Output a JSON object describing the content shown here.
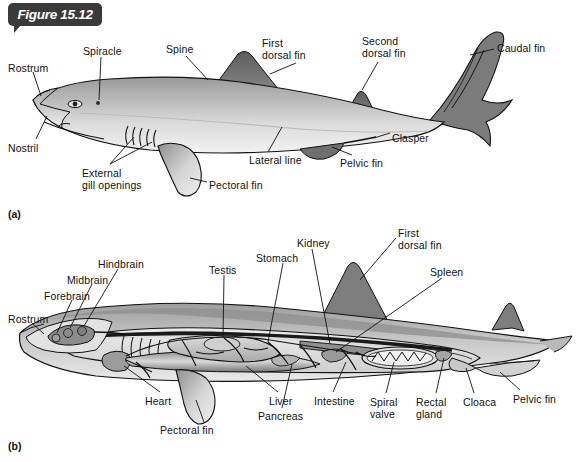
{
  "figure": {
    "tag_label": "Figure 15.12",
    "panel_a_id": "(a)",
    "panel_b_id": "(b)",
    "background_color": "#ffffff",
    "tag_color": "#3a3a3a",
    "line_color": "#111111",
    "body_light": "#e8e8e8",
    "body_mid": "#b5b5b5",
    "body_dark": "#6e6e6e",
    "fin_dark": "#707070"
  },
  "panel_a": {
    "title": "External anatomy of a shark",
    "labels": [
      {
        "id": "rostrum",
        "text": "Rostrum",
        "x": 8,
        "y": 63
      },
      {
        "id": "spiracle",
        "text": "Spiracle",
        "x": 83,
        "y": 46
      },
      {
        "id": "spine",
        "text": "Spine",
        "x": 166,
        "y": 44
      },
      {
        "id": "first-dorsal",
        "text": "First\ndorsal fin",
        "x": 262,
        "y": 38
      },
      {
        "id": "second-dorsal",
        "text": "Second\ndorsal fin",
        "x": 362,
        "y": 36
      },
      {
        "id": "caudal-fin",
        "text": "Caudal fin",
        "x": 497,
        "y": 43
      },
      {
        "id": "clasper",
        "text": "Clasper",
        "x": 392,
        "y": 133
      },
      {
        "id": "pelvic-fin",
        "text": "Pelvic fin",
        "x": 340,
        "y": 158
      },
      {
        "id": "lateral-line",
        "text": "Lateral line",
        "x": 249,
        "y": 155
      },
      {
        "id": "pectoral-fin",
        "text": "Pectoral fin",
        "x": 209,
        "y": 180
      },
      {
        "id": "gill-openings",
        "text": "External\ngill openings",
        "x": 82,
        "y": 168
      },
      {
        "id": "nostril",
        "text": "Nostril",
        "x": 8,
        "y": 143
      }
    ]
  },
  "panel_b": {
    "title": "Internal anatomy of a shark",
    "labels": [
      {
        "id": "rostrum-b",
        "text": "Rostrum",
        "x": 8,
        "y": 314
      },
      {
        "id": "forebrain",
        "text": "Forebrain",
        "x": 44,
        "y": 291
      },
      {
        "id": "midbrain",
        "text": "Midbrain",
        "x": 67,
        "y": 275
      },
      {
        "id": "hindbrain",
        "text": "Hindbrain",
        "x": 98,
        "y": 259
      },
      {
        "id": "testis",
        "text": "Testis",
        "x": 209,
        "y": 265
      },
      {
        "id": "stomach",
        "text": "Stomach",
        "x": 256,
        "y": 253
      },
      {
        "id": "kidney",
        "text": "Kidney",
        "x": 297,
        "y": 238
      },
      {
        "id": "first-dorsal-b",
        "text": "First\ndorsal fin",
        "x": 398,
        "y": 228
      },
      {
        "id": "spleen",
        "text": "Spleen",
        "x": 430,
        "y": 267
      },
      {
        "id": "pelvic-fin-b",
        "text": "Pelvic fin",
        "x": 513,
        "y": 394
      },
      {
        "id": "cloaca",
        "text": "Cloaca",
        "x": 463,
        "y": 397
      },
      {
        "id": "rectal-gland",
        "text": "Rectal\ngland",
        "x": 416,
        "y": 397
      },
      {
        "id": "spiral-valve",
        "text": "Spiral\nvalve",
        "x": 370,
        "y": 397
      },
      {
        "id": "intestine",
        "text": "Intestine",
        "x": 314,
        "y": 396
      },
      {
        "id": "pancreas",
        "text": "Pancreas",
        "x": 258,
        "y": 411
      },
      {
        "id": "liver",
        "text": "Liver",
        "x": 269,
        "y": 396
      },
      {
        "id": "pectoral-fin-b",
        "text": "Pectoral fin",
        "x": 160,
        "y": 425
      },
      {
        "id": "heart",
        "text": "Heart",
        "x": 145,
        "y": 396
      }
    ]
  }
}
